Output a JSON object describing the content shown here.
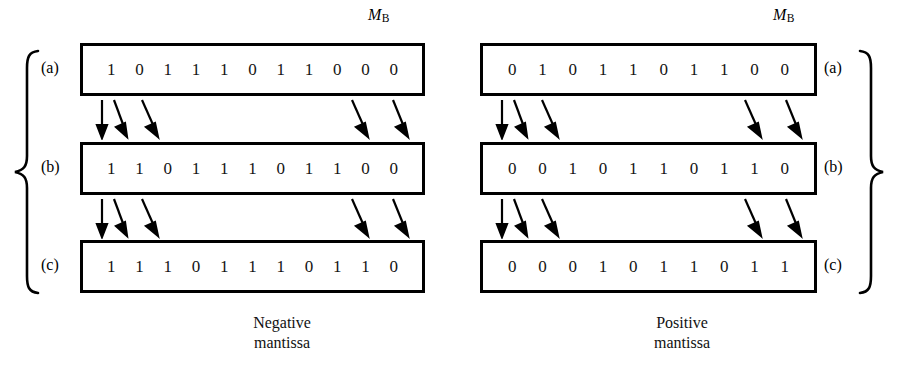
{
  "figure": {
    "register_label": {
      "base": "M",
      "subscript": "B"
    }
  },
  "panels": [
    {
      "id": "negative",
      "caption_line1": "Negative",
      "caption_line2": "mantissa",
      "brace_side": "left",
      "rows": [
        {
          "key": "a",
          "label": "(a)",
          "bits": [
            "1",
            "0",
            "1",
            "1",
            "1",
            "0",
            "1",
            "1",
            "0",
            "0",
            "0"
          ]
        },
        {
          "key": "b",
          "label": "(b)",
          "bits": [
            "1",
            "1",
            "0",
            "1",
            "1",
            "1",
            "0",
            "1",
            "1",
            "0",
            "0"
          ]
        },
        {
          "key": "c",
          "label": "(c)",
          "bits": [
            "1",
            "1",
            "1",
            "0",
            "1",
            "1",
            "1",
            "0",
            "1",
            "1",
            "0"
          ]
        }
      ]
    },
    {
      "id": "positive",
      "caption_line1": "Positive",
      "caption_line2": "mantissa",
      "brace_side": "right",
      "rows": [
        {
          "key": "a",
          "label": "(a)",
          "bits": [
            "0",
            "1",
            "0",
            "1",
            "1",
            "0",
            "1",
            "1",
            "0",
            "0"
          ]
        },
        {
          "key": "b",
          "label": "(b)",
          "bits": [
            "0",
            "0",
            "1",
            "0",
            "1",
            "1",
            "0",
            "1",
            "1",
            "0"
          ]
        },
        {
          "key": "c",
          "label": "(c)",
          "bits": [
            "0",
            "0",
            "0",
            "1",
            "0",
            "1",
            "1",
            "0",
            "1",
            "1"
          ]
        }
      ]
    }
  ],
  "colors": {
    "ink": "#000000",
    "bit_text": "#141414",
    "background": "#ffffff"
  }
}
